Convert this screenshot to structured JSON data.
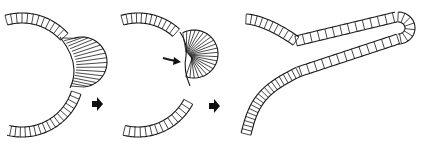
{
  "figure": {
    "panels": [
      {
        "id": 1,
        "label": "",
        "shape": "C-shaped ribbon with fan-shaped bulge on right"
      },
      {
        "id": 2,
        "label": "",
        "shape": "C-shaped ribbon with twisted fan bulge; arrow indicates site of rearrangement"
      },
      {
        "id": 3,
        "label": "",
        "shape": "Extended S-shaped ribbon with hairpin loop at upper right"
      }
    ],
    "arrows": [
      {
        "type": "transition",
        "from_panel": 1,
        "to_panel": 2
      },
      {
        "type": "indicator",
        "panel": 2,
        "points_to": "fan bulge"
      },
      {
        "type": "transition",
        "from_panel": 2,
        "to_panel": 3
      }
    ],
    "colors": {
      "ink": "#1a1a1a",
      "background": "#ffffff"
    }
  }
}
